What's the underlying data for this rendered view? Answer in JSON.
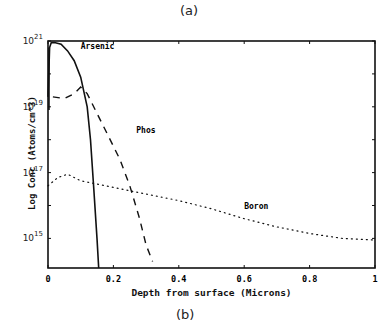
{
  "captions": {
    "top": "(a)",
    "bottom": "(b)"
  },
  "chart_data": {
    "type": "line",
    "title": "",
    "xlabel": "Depth from surface (Microns)",
    "ylabel": "Log Conc (Atoms/cm^3)",
    "xlim": [
      0,
      1
    ],
    "ylim_log10": [
      14.1,
      21
    ],
    "x_ticks": [
      "0",
      "0.2",
      "0.4",
      "0.6",
      "0.8",
      "1"
    ],
    "y_ticks": [
      {
        "label": "10",
        "exp": "21"
      },
      {
        "label": "10",
        "exp": "19"
      },
      {
        "label": "10",
        "exp": "17"
      },
      {
        "label": "10",
        "exp": "15"
      }
    ],
    "grid": false,
    "legend": "inline labels",
    "series": [
      {
        "name": "Arsenic",
        "style": "solid",
        "x": [
          0.0,
          0.005,
          0.01,
          0.02,
          0.04,
          0.06,
          0.08,
          0.1,
          0.12,
          0.13,
          0.14,
          0.15,
          0.155
        ],
        "log10_y": [
          19.3,
          20.8,
          20.95,
          20.95,
          20.9,
          20.7,
          20.4,
          19.9,
          19.0,
          18.0,
          16.5,
          15.0,
          14.1
        ]
      },
      {
        "name": "Phos",
        "style": "dashed",
        "x": [
          0.015,
          0.05,
          0.08,
          0.1,
          0.12,
          0.15,
          0.18,
          0.22,
          0.25,
          0.28,
          0.3,
          0.32
        ],
        "log10_y": [
          19.3,
          19.25,
          19.4,
          19.6,
          19.4,
          18.8,
          18.2,
          17.4,
          16.6,
          15.6,
          14.8,
          14.3
        ]
      },
      {
        "name": "Boron",
        "style": "dotted",
        "x": [
          0.0,
          0.03,
          0.06,
          0.1,
          0.2,
          0.3,
          0.4,
          0.5,
          0.6,
          0.7,
          0.8,
          0.9,
          1.0
        ],
        "log10_y": [
          16.6,
          16.85,
          16.95,
          16.75,
          16.55,
          16.35,
          16.15,
          15.9,
          15.6,
          15.35,
          15.15,
          15.0,
          14.95
        ]
      }
    ],
    "annotations": [
      {
        "text": "Arsenic",
        "x": 0.1,
        "log10_y": 20.75
      },
      {
        "text": "Phos",
        "x": 0.27,
        "log10_y": 18.2
      },
      {
        "text": "Boron",
        "x": 0.6,
        "log10_y": 15.9
      }
    ]
  }
}
